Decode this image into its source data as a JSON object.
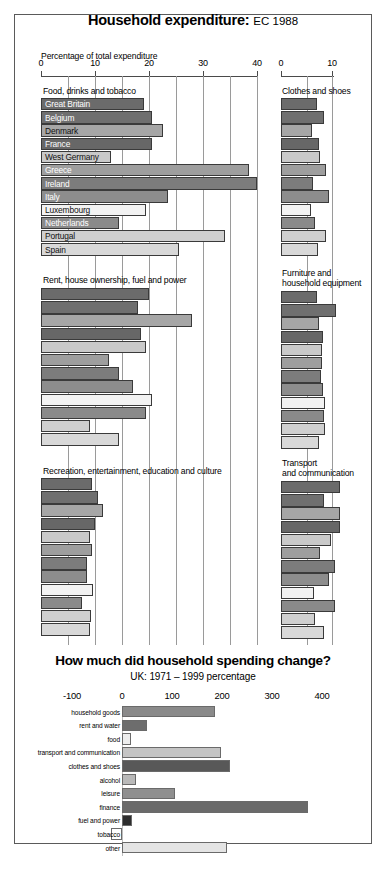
{
  "header": {
    "title_bold": "Household expenditure:",
    "title_light": "EC 1988"
  },
  "top_chart": {
    "axis_caption": "Percentage of total expenditure",
    "left_axis_ticks": [
      "0",
      "10",
      "20",
      "30",
      "40"
    ],
    "right_axis_ticks": [
      "0",
      "10"
    ],
    "panels": [
      {
        "caption": "Food, drinks and tobacco"
      },
      {
        "caption": "Clothes and shoes"
      },
      {
        "caption": "Rent, house ownership, fuel and power"
      },
      {
        "caption": "Furniture and\nhousehold equipment"
      },
      {
        "caption": "Recreation, entertainment, education and culture"
      },
      {
        "caption": "Transport\nand communication"
      }
    ],
    "countries": [
      "Great Britain",
      "Belgium",
      "Denmark",
      "France",
      "West Germany",
      "Greece",
      "Ireland",
      "Italy",
      "Luxembourg",
      "Netherlands",
      "Portugal",
      "Spain"
    ]
  },
  "bottom_chart": {
    "title": "How much did household spending change?",
    "subtitle": "UK: 1971 – 1999 percentage",
    "ticks": [
      "-100",
      "0",
      "100",
      "200",
      "300",
      "400"
    ]
  },
  "chart_data": [
    {
      "type": "bar",
      "title": "Food, drinks and tobacco",
      "orientation": "horizontal",
      "xlabel": "Percentage of total expenditure",
      "xlim": [
        0,
        41
      ],
      "categories": [
        "Great Britain",
        "Belgium",
        "Denmark",
        "France",
        "West Germany",
        "Greece",
        "Ireland",
        "Italy",
        "Luxembourg",
        "Netherlands",
        "Portugal",
        "Spain"
      ],
      "values": [
        19.0,
        20.5,
        22.5,
        20.5,
        13.0,
        38.5,
        40.0,
        23.5,
        19.5,
        14.5,
        34.0,
        25.5
      ],
      "grid": true
    },
    {
      "type": "bar",
      "title": "Clothes and shoes",
      "orientation": "horizontal",
      "xlim": [
        0,
        12.5
      ],
      "categories": [
        "Great Britain",
        "Belgium",
        "Denmark",
        "France",
        "West Germany",
        "Greece",
        "Ireland",
        "Italy",
        "Luxembourg",
        "Netherlands",
        "Portugal",
        "Spain"
      ],
      "values": [
        7.0,
        8.4,
        6.0,
        7.4,
        7.6,
        8.8,
        6.2,
        9.5,
        5.8,
        6.6,
        8.8,
        7.3
      ],
      "grid": true
    },
    {
      "type": "bar",
      "title": "Rent, house ownership, fuel and power",
      "orientation": "horizontal",
      "xlim": [
        0,
        41
      ],
      "categories": [
        "Great Britain",
        "Belgium",
        "Denmark",
        "France",
        "West Germany",
        "Greece",
        "Ireland",
        "Italy",
        "Luxembourg",
        "Netherlands",
        "Portugal",
        "Spain"
      ],
      "values": [
        20.0,
        18.0,
        28.0,
        18.5,
        19.5,
        12.5,
        14.5,
        17.0,
        20.5,
        19.5,
        9.0,
        14.5
      ],
      "grid": true
    },
    {
      "type": "bar",
      "title": "Furniture and household equipment",
      "orientation": "horizontal",
      "xlim": [
        0,
        12.5
      ],
      "categories": [
        "Great Britain",
        "Belgium",
        "Denmark",
        "France",
        "West Germany",
        "Greece",
        "Ireland",
        "Italy",
        "Luxembourg",
        "Netherlands",
        "Portugal",
        "Spain"
      ],
      "values": [
        7.0,
        10.8,
        7.5,
        8.2,
        8.0,
        8.0,
        7.8,
        8.2,
        8.6,
        8.4,
        8.6,
        7.4
      ],
      "grid": true
    },
    {
      "type": "bar",
      "title": "Recreation, entertainment, education and culture",
      "orientation": "horizontal",
      "xlim": [
        0,
        41
      ],
      "categories": [
        "Great Britain",
        "Belgium",
        "Denmark",
        "France",
        "West Germany",
        "Greece",
        "Ireland",
        "Italy",
        "Luxembourg",
        "Netherlands",
        "Portugal",
        "Spain"
      ],
      "values": [
        9.5,
        10.5,
        11.5,
        10.0,
        9.0,
        9.5,
        8.5,
        8.5,
        9.7,
        7.5,
        9.3,
        9.0
      ],
      "grid": true
    },
    {
      "type": "bar",
      "title": "Transport and communication",
      "orientation": "horizontal",
      "xlim": [
        0,
        12.5
      ],
      "categories": [
        "Great Britain",
        "Belgium",
        "Denmark",
        "France",
        "West Germany",
        "Greece",
        "Ireland",
        "Italy",
        "Luxembourg",
        "Netherlands",
        "Portugal",
        "Spain"
      ],
      "values": [
        11.5,
        8.4,
        11.5,
        11.5,
        9.8,
        7.6,
        10.6,
        9.4,
        6.4,
        10.6,
        6.6,
        8.4
      ],
      "grid": true
    },
    {
      "type": "bar",
      "title": "How much did household spending change?",
      "subtitle": "UK: 1971 – 1999 percentage",
      "orientation": "horizontal",
      "xlim": [
        -100,
        400
      ],
      "categories": [
        "household goods",
        "rent and water",
        "food",
        "transport and communication",
        "clothes and shoes",
        "alcohol",
        "leisure",
        "finance",
        "fuel and power",
        "tobacco",
        "other"
      ],
      "values": [
        185,
        50,
        18,
        198,
        215,
        28,
        105,
        372,
        20,
        -22,
        210
      ],
      "grid": false
    }
  ]
}
